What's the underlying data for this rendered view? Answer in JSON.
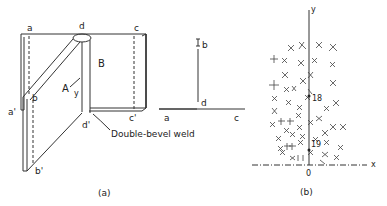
{
  "figure_a": {
    "caption": "(a)",
    "labels": {
      "a": "a",
      "d": "d",
      "c": "c",
      "B": "B",
      "A": "A",
      "y": "y",
      "b": "b",
      "a_prime": "a'",
      "c_prime": "c'",
      "d_prime": "d'",
      "b_prime": "b'"
    },
    "callout": "Double-bevel weld"
  },
  "section": {
    "labels": {
      "b": "b",
      "d": "d",
      "a": "a",
      "c": "c"
    }
  },
  "figure_b": {
    "caption": "(b)",
    "axis_x": "x",
    "axis_y": "y",
    "origin": "0",
    "point_labels": [
      "18",
      "19"
    ]
  }
}
